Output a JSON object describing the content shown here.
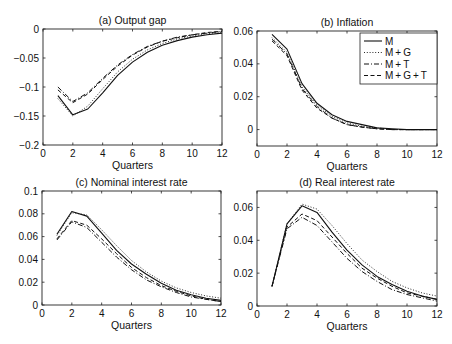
{
  "figure": {
    "legend": {
      "entries": [
        {
          "name": "M",
          "style": "solid"
        },
        {
          "name": "M+G",
          "style": "dotted"
        },
        {
          "name": "M+T",
          "style": "dashdot"
        },
        {
          "name": "M+G+T",
          "style": "dashed"
        }
      ],
      "position": "panel-b-upper-right"
    },
    "line_color": "#111111",
    "axis_color": "#222222"
  },
  "chart_data": [
    {
      "type": "line",
      "title": "(a) Output gap",
      "xlabel": "Quarters",
      "ylabel": "",
      "xlim": [
        0,
        12
      ],
      "ylim": [
        -0.2,
        0
      ],
      "xticks": [
        0,
        2,
        4,
        6,
        8,
        10,
        12
      ],
      "yticks": [
        -0.2,
        -0.15,
        -0.1,
        -0.05,
        0
      ],
      "ytick_labels": [
        "-0.2",
        "-0.15",
        "-0.1",
        "-0.05",
        "0"
      ],
      "grid": false,
      "x": [
        1,
        2,
        3,
        4,
        5,
        6,
        7,
        8,
        9,
        10,
        11,
        12
      ],
      "series": [
        {
          "name": "M",
          "values": [
            -0.115,
            -0.148,
            -0.138,
            -0.11,
            -0.08,
            -0.057,
            -0.04,
            -0.028,
            -0.02,
            -0.014,
            -0.01,
            -0.007
          ]
        },
        {
          "name": "M+G",
          "values": [
            -0.12,
            -0.15,
            -0.133,
            -0.103,
            -0.074,
            -0.052,
            -0.036,
            -0.025,
            -0.017,
            -0.012,
            -0.008,
            -0.006
          ]
        },
        {
          "name": "M+T",
          "values": [
            -0.1,
            -0.125,
            -0.11,
            -0.085,
            -0.062,
            -0.044,
            -0.03,
            -0.021,
            -0.014,
            -0.01,
            -0.007,
            -0.004
          ]
        },
        {
          "name": "M+G+T",
          "values": [
            -0.105,
            -0.127,
            -0.112,
            -0.087,
            -0.064,
            -0.045,
            -0.031,
            -0.021,
            -0.015,
            -0.01,
            -0.006,
            -0.004
          ]
        }
      ]
    },
    {
      "type": "line",
      "title": "(b) Inflation",
      "xlabel": "Quarters",
      "ylabel": "",
      "xlim": [
        0,
        12
      ],
      "ylim": [
        -0.01,
        0.06
      ],
      "xticks": [
        0,
        2,
        4,
        6,
        8,
        10,
        12
      ],
      "yticks": [
        0,
        0.02,
        0.04,
        0.06
      ],
      "ytick_labels": [
        "0",
        "0.02",
        "0.04",
        "0.06"
      ],
      "grid": false,
      "legend": true,
      "x": [
        1,
        2,
        3,
        4,
        5,
        6,
        7,
        8,
        9,
        10,
        11,
        12
      ],
      "series": [
        {
          "name": "M",
          "values": [
            0.058,
            0.049,
            0.028,
            0.016,
            0.009,
            0.005,
            0.003,
            0.001,
            0.0005,
            0,
            0,
            0
          ]
        },
        {
          "name": "M+G",
          "values": [
            0.056,
            0.047,
            0.026,
            0.015,
            0.008,
            0.004,
            0.002,
            0.001,
            0,
            0,
            0,
            0
          ]
        },
        {
          "name": "M+T",
          "values": [
            0.055,
            0.046,
            0.025,
            0.014,
            0.007,
            0.003,
            0.0015,
            0.0005,
            0,
            0,
            0,
            0
          ]
        },
        {
          "name": "M+G+T",
          "values": [
            0.054,
            0.045,
            0.024,
            0.013,
            0.007,
            0.003,
            0.0015,
            0.0005,
            0,
            0,
            0,
            0
          ]
        }
      ]
    },
    {
      "type": "line",
      "title": "(c) Nominal interest rate",
      "xlabel": "Quarters",
      "ylabel": "",
      "xlim": [
        0,
        12
      ],
      "ylim": [
        0,
        0.1
      ],
      "xticks": [
        0,
        2,
        4,
        6,
        8,
        10,
        12
      ],
      "yticks": [
        0,
        0.02,
        0.04,
        0.06,
        0.08,
        0.1
      ],
      "ytick_labels": [
        "0",
        "0.02",
        "0.04",
        "0.06",
        "0.08",
        "0.1"
      ],
      "grid": false,
      "x": [
        1,
        2,
        3,
        4,
        5,
        6,
        7,
        8,
        9,
        10,
        11,
        12
      ],
      "series": [
        {
          "name": "M",
          "values": [
            0.062,
            0.082,
            0.078,
            0.063,
            0.048,
            0.036,
            0.027,
            0.019,
            0.013,
            0.009,
            0.006,
            0.004
          ]
        },
        {
          "name": "M+G",
          "values": [
            0.061,
            0.081,
            0.079,
            0.066,
            0.052,
            0.039,
            0.029,
            0.021,
            0.015,
            0.011,
            0.008,
            0.006
          ]
        },
        {
          "name": "M+T",
          "values": [
            0.057,
            0.073,
            0.068,
            0.055,
            0.042,
            0.031,
            0.022,
            0.016,
            0.011,
            0.007,
            0.005,
            0.003
          ]
        },
        {
          "name": "M+G+T",
          "values": [
            0.058,
            0.074,
            0.07,
            0.058,
            0.045,
            0.033,
            0.024,
            0.017,
            0.012,
            0.008,
            0.005,
            0.003
          ]
        }
      ]
    },
    {
      "type": "line",
      "title": "(d) Real interest rate",
      "xlabel": "Quarters",
      "ylabel": "",
      "xlim": [
        0,
        12
      ],
      "ylim": [
        0,
        0.07
      ],
      "xticks": [
        0,
        2,
        4,
        6,
        8,
        10,
        12
      ],
      "yticks": [
        0,
        0.02,
        0.04,
        0.06
      ],
      "ytick_labels": [
        "0",
        "0.02",
        "0.04",
        "0.06"
      ],
      "grid": false,
      "x": [
        1,
        2,
        3,
        4,
        5,
        6,
        7,
        8,
        9,
        10,
        11,
        12
      ],
      "series": [
        {
          "name": "M",
          "values": [
            0.012,
            0.05,
            0.061,
            0.057,
            0.045,
            0.034,
            0.025,
            0.018,
            0.013,
            0.009,
            0.006,
            0.004
          ]
        },
        {
          "name": "M+G",
          "values": [
            0.012,
            0.05,
            0.062,
            0.059,
            0.049,
            0.038,
            0.028,
            0.021,
            0.015,
            0.011,
            0.008,
            0.006
          ]
        },
        {
          "name": "M+T",
          "values": [
            0.012,
            0.047,
            0.054,
            0.049,
            0.039,
            0.029,
            0.021,
            0.015,
            0.01,
            0.007,
            0.005,
            0.003
          ]
        },
        {
          "name": "M+G+T",
          "values": [
            0.012,
            0.048,
            0.056,
            0.052,
            0.042,
            0.032,
            0.023,
            0.017,
            0.012,
            0.008,
            0.006,
            0.004
          ]
        }
      ]
    }
  ]
}
